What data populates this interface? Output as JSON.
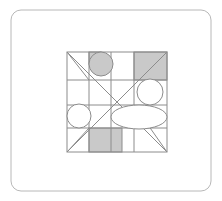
{
  "page": {
    "width": 222,
    "height": 201,
    "background": "#ffffff"
  },
  "colors": {
    "background": "#ffffff",
    "outer_border": "#b8b8b8",
    "grid_stroke": "#8c8c8c",
    "diagonal_stroke": "#8c8c8c",
    "shape_stroke": "#8c8c8c",
    "shaded_fill": "#c9c9c9",
    "unfilled_fill": "#ffffff"
  },
  "outer_frame": {
    "label": "outer-rounded-rectangle",
    "x": 11,
    "y": 10,
    "width": 200,
    "height": 181,
    "rx": 10,
    "stroke_width": 1
  },
  "inner_square": {
    "label": "inner-square",
    "x": 67,
    "y": 52,
    "width": 100,
    "height": 100,
    "stroke_width": 1
  },
  "grid_lines": {
    "vertical_x": [
      89,
      111,
      134
    ],
    "horizontal_y": [
      80,
      105,
      128
    ]
  },
  "diagonals": [
    {
      "name": "main-diagonal",
      "x1": 67,
      "y1": 52,
      "x2": 167,
      "y2": 152
    },
    {
      "name": "anti-diagonal",
      "x1": 67,
      "y1": 152,
      "x2": 167,
      "y2": 52
    },
    {
      "name": "short-diagonal-top-left",
      "x1": 67,
      "y1": 52,
      "x2": 89,
      "y2": 80
    },
    {
      "name": "short-diagonal-bottom-left",
      "x1": 67,
      "y1": 152,
      "x2": 89,
      "y2": 128
    },
    {
      "name": "short-diagonal-mid-right",
      "x1": 134,
      "y1": 105,
      "x2": 167,
      "y2": 152
    }
  ],
  "shaded_regions": [
    {
      "name": "small-square-top",
      "x": 89,
      "y": 52,
      "width": 12,
      "height": 12
    },
    {
      "name": "rect-top-right",
      "x": 134,
      "y": 52,
      "width": 33,
      "height": 28
    },
    {
      "name": "rect-bottom-center",
      "x": 89,
      "y": 128,
      "width": 33,
      "height": 24
    }
  ],
  "circles": [
    {
      "name": "shaded-circle-top",
      "cx": 101,
      "cy": 64,
      "r": 12,
      "fill": "shaded"
    },
    {
      "name": "white-circle-left",
      "cx": 79,
      "cy": 116,
      "r": 12,
      "fill": "unfilled"
    },
    {
      "name": "white-circle-right",
      "cx": 150,
      "cy": 92,
      "r": 13,
      "fill": "unfilled"
    }
  ],
  "ellipses": [
    {
      "name": "white-ellipse-lower-right",
      "cx": 139,
      "cy": 117,
      "rx": 28,
      "ry": 12,
      "fill": "unfilled"
    }
  ],
  "shape_counts": {
    "shaded_rectangles": 3,
    "shaded_circles": 1,
    "unfilled_circles": 2,
    "unfilled_ellipses": 1
  }
}
